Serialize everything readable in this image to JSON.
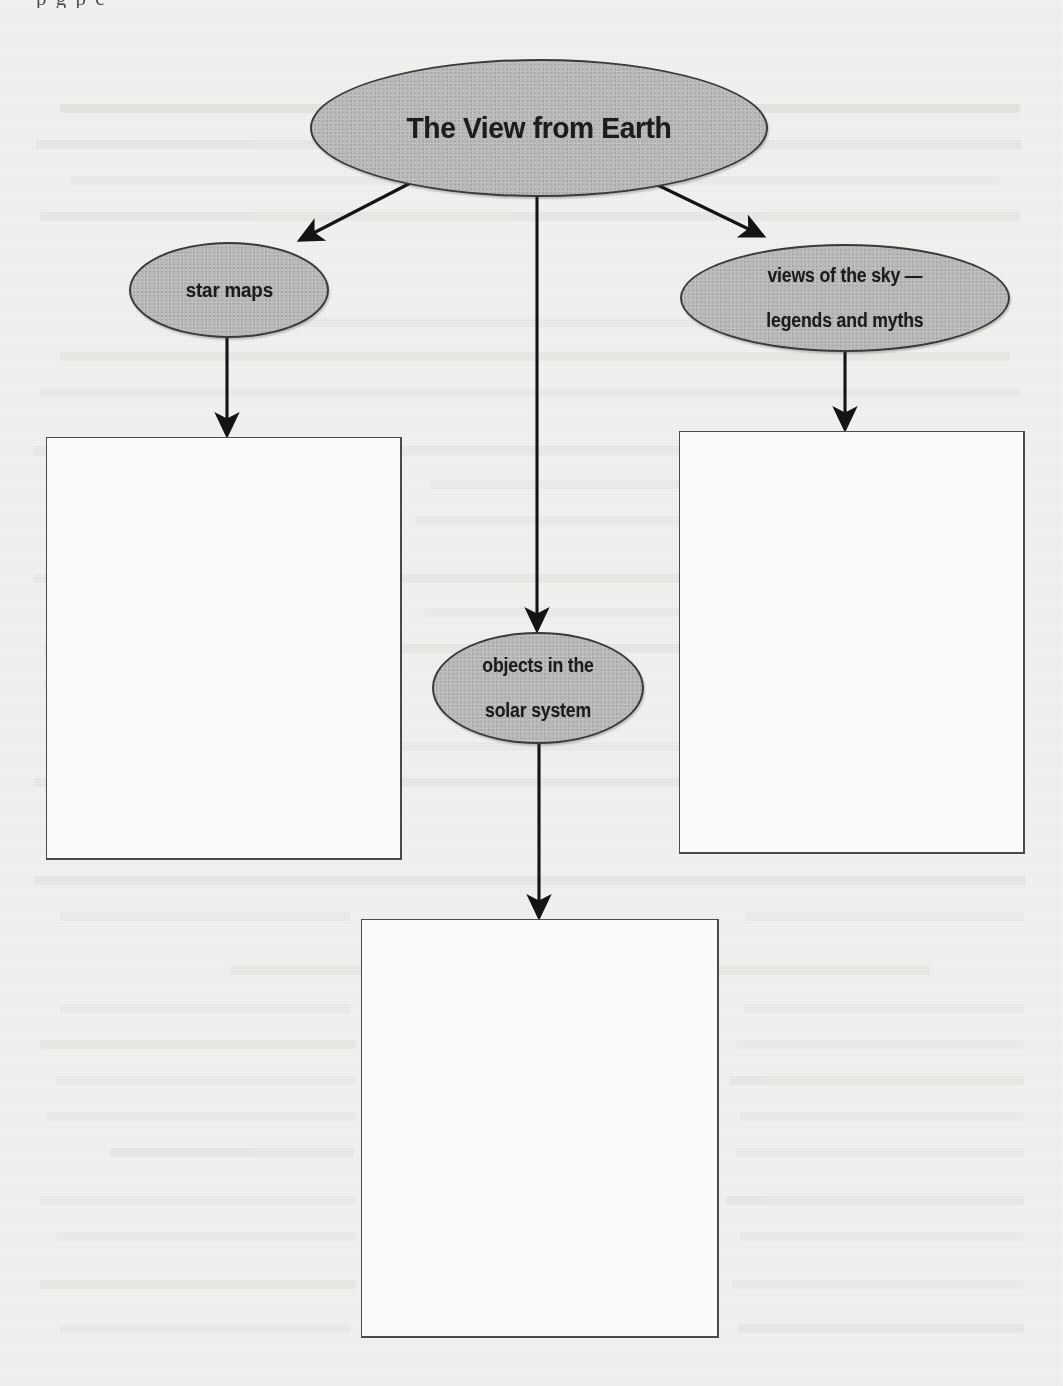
{
  "page": {
    "background_color": "#f3f1ef",
    "node_fill_color": "#b9b9b9",
    "node_border_color": "#3a3a3a",
    "line_color": "#1c1c1c",
    "box_border_color": "#4a4a4a",
    "top_clipped_text": "p g p c"
  },
  "diagram": {
    "type": "concept-map",
    "root": {
      "id": "root",
      "label": "The View from Earth",
      "shape": "ellipse"
    },
    "branches": [
      {
        "id": "star-maps",
        "label": "star maps",
        "shape": "ellipse",
        "answer_box": {
          "id": "box-left",
          "label": "",
          "empty": true
        }
      },
      {
        "id": "objects-solar-system",
        "label": "objects in the\nsolar system",
        "label_line1": "objects in the",
        "label_line2": "solar system",
        "shape": "ellipse",
        "answer_box": {
          "id": "box-bottom",
          "label": "",
          "empty": true
        }
      },
      {
        "id": "views-of-the-sky",
        "label": "views of the sky —\nlegends and myths",
        "label_line1": "views of the sky —",
        "label_line2": "legends and myths",
        "shape": "ellipse",
        "answer_box": {
          "id": "box-right",
          "label": "",
          "empty": true
        }
      }
    ],
    "connectors": [
      {
        "from": "root",
        "to": "star-maps",
        "style": "arrow"
      },
      {
        "from": "root",
        "to": "objects-solar-system",
        "style": "arrow"
      },
      {
        "from": "root",
        "to": "views-of-the-sky",
        "style": "arrow"
      },
      {
        "from": "star-maps",
        "to": "box-left",
        "style": "arrow"
      },
      {
        "from": "objects-solar-system",
        "to": "box-bottom",
        "style": "arrow"
      },
      {
        "from": "views-of-the-sky",
        "to": "box-right",
        "style": "arrow"
      }
    ]
  }
}
